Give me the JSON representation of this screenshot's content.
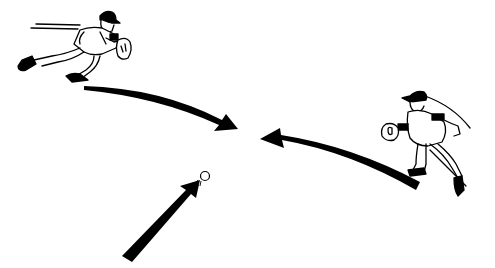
{
  "illustration": {
    "subject": "Two baseball fielders converging on a batted ball",
    "colors": {
      "ink": "#000000",
      "paper": "#ffffff"
    },
    "figures": [
      {
        "id": "left-fielder",
        "pose": "running right, glove extended"
      },
      {
        "id": "right-fielder",
        "pose": "running left, glove extended"
      }
    ],
    "arrows": [
      {
        "id": "left-arrow",
        "direction": "curving right toward center"
      },
      {
        "id": "right-arrow",
        "direction": "curving left toward center"
      },
      {
        "id": "ball-arrow",
        "direction": "up-right toward ball"
      }
    ],
    "ball": {
      "id": "baseball",
      "state": "in flight"
    }
  }
}
